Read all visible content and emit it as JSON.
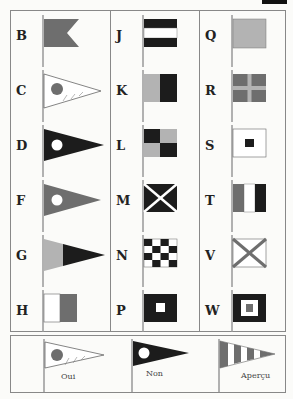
{
  "colors": {
    "red": "#6e6e6e",
    "blue": "#1c1c1c",
    "yellow": "#b3b3b3",
    "white": "#ffffff",
    "pole": "#999999",
    "border": "#888888"
  },
  "columns": [
    {
      "flags": [
        {
          "letter": "B",
          "type": "swallowtail"
        },
        {
          "letter": "C",
          "type": "pennant-white-red-disc"
        },
        {
          "letter": "D",
          "type": "pennant-blue-white-disc"
        },
        {
          "letter": "F",
          "type": "pennant-red-white-disc"
        },
        {
          "letter": "G",
          "type": "pennant-yellow-blue"
        },
        {
          "letter": "H",
          "type": "vertical-white-red"
        }
      ]
    },
    {
      "flags": [
        {
          "letter": "J",
          "type": "horizontal-blue-white-blue"
        },
        {
          "letter": "K",
          "type": "vertical-yellow-blue"
        },
        {
          "letter": "L",
          "type": "quartered-blue-yellow"
        },
        {
          "letter": "M",
          "type": "blue-white-saltire"
        },
        {
          "letter": "N",
          "type": "checkered-blue-white"
        },
        {
          "letter": "P",
          "type": "blue-white-square"
        }
      ]
    },
    {
      "flags": [
        {
          "letter": "Q",
          "type": "solid-yellow"
        },
        {
          "letter": "R",
          "type": "red-yellow-cross"
        },
        {
          "letter": "S",
          "type": "white-blue-square"
        },
        {
          "letter": "T",
          "type": "vertical-red-white-blue"
        },
        {
          "letter": "V",
          "type": "white-red-saltire"
        },
        {
          "letter": "W",
          "type": "blue-white-red-square"
        }
      ]
    }
  ],
  "answer_pennants": [
    {
      "label": "Oui"
    },
    {
      "label": "Non"
    },
    {
      "label": "Aperçu"
    }
  ]
}
